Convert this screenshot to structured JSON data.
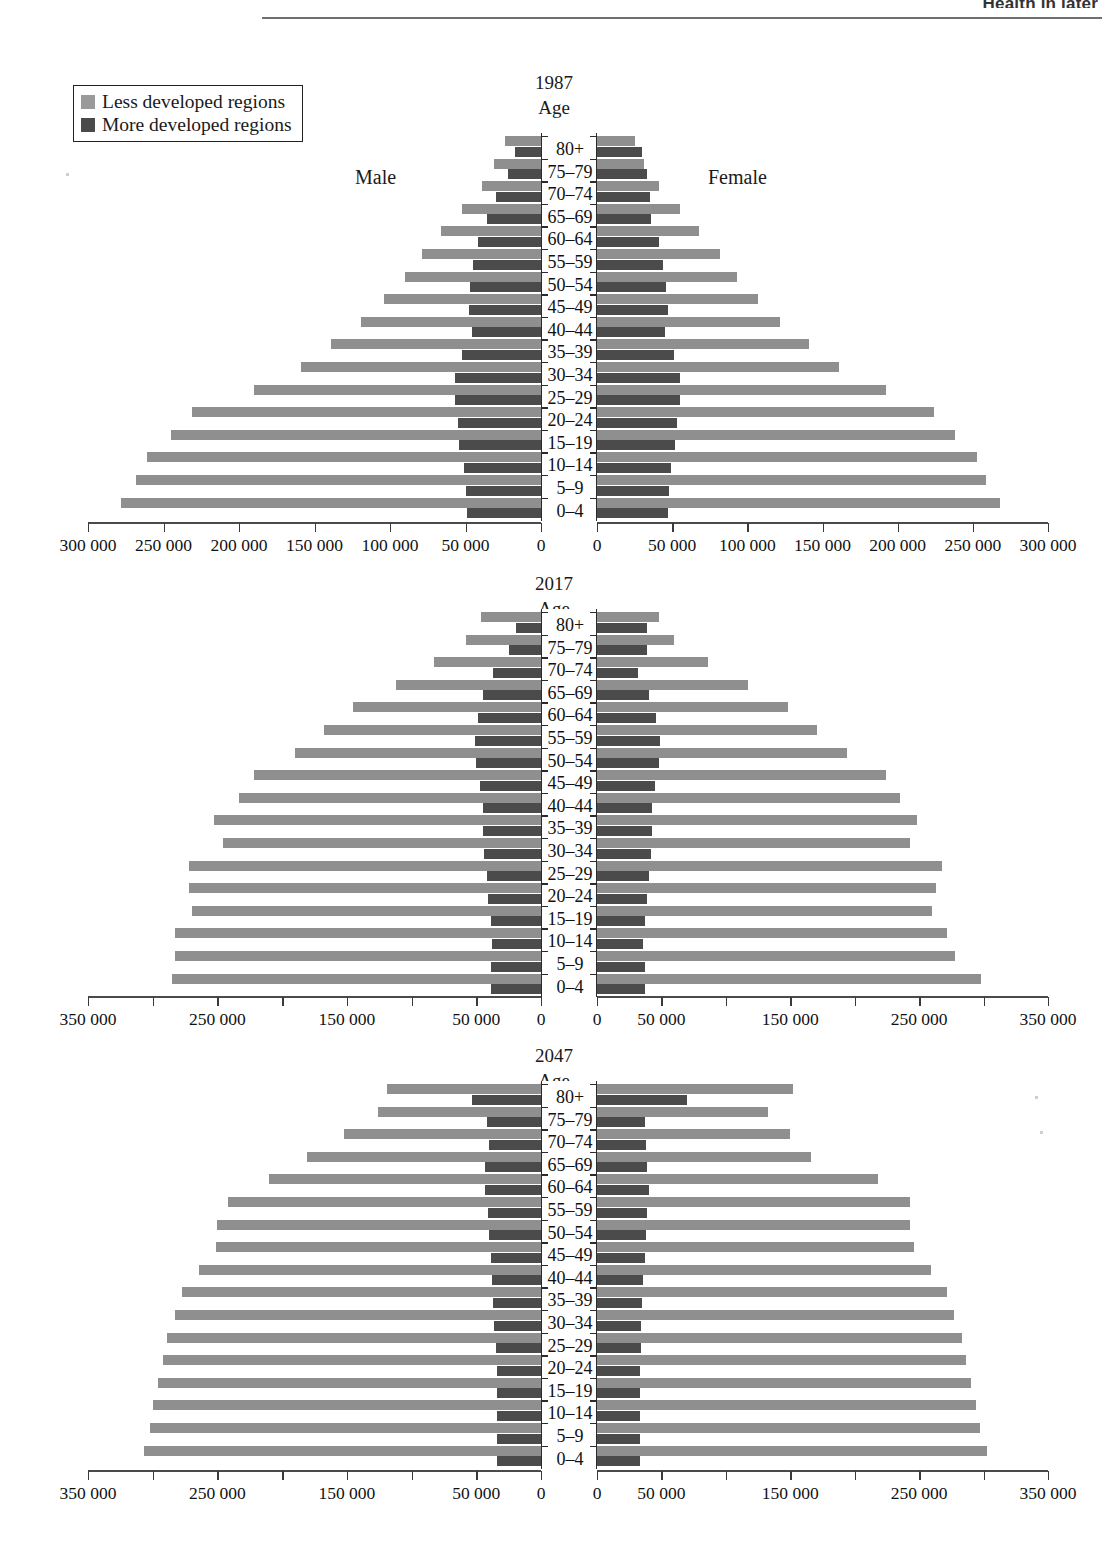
{
  "header": {
    "running_title": "Health in later"
  },
  "legend": {
    "items": [
      {
        "label": "Less developed regions",
        "color": "#9a9a9a",
        "key": "less"
      },
      {
        "label": "More developed regions",
        "color": "#4a4a4a",
        "key": "more"
      }
    ]
  },
  "labels": {
    "age_heading": "Age",
    "male": "Male",
    "female": "Female"
  },
  "age_groups": [
    "80+",
    "75–79",
    "70–74",
    "65–69",
    "60–64",
    "55–59",
    "50–54",
    "45–49",
    "40–44",
    "35–39",
    "30–34",
    "25–29",
    "20–24",
    "15–19",
    "10–14",
    "5–9",
    "0–4"
  ],
  "chart_data": [
    {
      "type": "bar",
      "subtype": "population-pyramid",
      "title": "1987",
      "xlabel": "",
      "ylabel": "Age",
      "xlim": [
        0,
        300000
      ],
      "axis_ticks": [
        300000,
        250000,
        200000,
        150000,
        100000,
        50000,
        0
      ],
      "axis_tick_labels": [
        "300 000",
        "250 000",
        "200 000",
        "150 000",
        "100 000",
        "50 000",
        "0"
      ],
      "axis_label_every": 50000,
      "grid": false,
      "legend_position": "top-left",
      "categories": [
        "80+",
        "75–79",
        "70–74",
        "65–69",
        "60–64",
        "55–59",
        "50–54",
        "45–49",
        "40–44",
        "35–39",
        "30–34",
        "25–29",
        "20–24",
        "15–19",
        "10–14",
        "5–9",
        "0–4"
      ],
      "series": [
        {
          "name": "Less developed regions",
          "side": "male",
          "values": [
            24000,
            31000,
            39000,
            52000,
            66000,
            79000,
            90000,
            104000,
            119000,
            139000,
            159000,
            190000,
            231000,
            245000,
            261000,
            268000,
            278000
          ]
        },
        {
          "name": "More developed regions",
          "side": "male",
          "values": [
            17000,
            22000,
            30000,
            36000,
            42000,
            45000,
            47000,
            48000,
            46000,
            52000,
            57000,
            57000,
            55000,
            54000,
            51000,
            50000,
            49000
          ]
        },
        {
          "name": "Less developed regions",
          "side": "female",
          "values": [
            25000,
            31000,
            41000,
            55000,
            68000,
            82000,
            93000,
            107000,
            122000,
            141000,
            161000,
            192000,
            224000,
            238000,
            253000,
            259000,
            268000
          ]
        },
        {
          "name": "More developed regions",
          "side": "female",
          "values": [
            30000,
            33000,
            35000,
            36000,
            41000,
            44000,
            46000,
            47000,
            45000,
            51000,
            55000,
            55000,
            53000,
            52000,
            49000,
            48000,
            47000
          ]
        }
      ]
    },
    {
      "type": "bar",
      "subtype": "population-pyramid",
      "title": "2017",
      "xlabel": "",
      "ylabel": "Age",
      "xlim": [
        0,
        350000
      ],
      "axis_ticks": [
        350000,
        300000,
        250000,
        200000,
        150000,
        100000,
        50000,
        0
      ],
      "axis_tick_labels": [
        "350 000",
        "",
        "250 000",
        "",
        "150 000",
        "",
        "50 000",
        "0"
      ],
      "axis_label_every": 100000,
      "grid": false,
      "legend_position": "none",
      "categories": [
        "80+",
        "75–79",
        "70–74",
        "65–69",
        "60–64",
        "55–59",
        "50–54",
        "45–49",
        "40–44",
        "35–39",
        "30–34",
        "25–29",
        "20–24",
        "15–19",
        "10–14",
        "5–9",
        "0–4"
      ],
      "series": [
        {
          "name": "Less developed regions",
          "side": "male",
          "values": [
            46000,
            58000,
            83000,
            112000,
            145000,
            168000,
            190000,
            222000,
            233000,
            253000,
            246000,
            272000,
            272000,
            270000,
            283000,
            283000,
            285000
          ]
        },
        {
          "name": "More developed regions",
          "side": "male",
          "values": [
            19000,
            25000,
            37000,
            45000,
            49000,
            51000,
            50000,
            47000,
            45000,
            45000,
            44000,
            42000,
            41000,
            39000,
            38000,
            39000,
            39000
          ]
        },
        {
          "name": "Less developed regions",
          "side": "female",
          "values": [
            48000,
            60000,
            86000,
            117000,
            148000,
            171000,
            194000,
            224000,
            235000,
            248000,
            243000,
            268000,
            263000,
            260000,
            272000,
            278000,
            298000
          ]
        },
        {
          "name": "More developed regions",
          "side": "female",
          "values": [
            39000,
            39000,
            32000,
            40000,
            46000,
            49000,
            48000,
            45000,
            43000,
            43000,
            42000,
            40000,
            39000,
            37000,
            36000,
            37000,
            37000
          ]
        }
      ]
    },
    {
      "type": "bar",
      "subtype": "population-pyramid",
      "title": "2047",
      "xlabel": "",
      "ylabel": "Age",
      "xlim": [
        0,
        350000
      ],
      "axis_ticks": [
        350000,
        300000,
        250000,
        200000,
        150000,
        100000,
        50000,
        0
      ],
      "axis_tick_labels": [
        "350 000",
        "",
        "250 000",
        "",
        "150 000",
        "",
        "50 000",
        "0"
      ],
      "axis_label_every": 100000,
      "grid": false,
      "legend_position": "none",
      "categories": [
        "80+",
        "75–79",
        "70–74",
        "65–69",
        "60–64",
        "55–59",
        "50–54",
        "45–49",
        "40–44",
        "35–39",
        "30–34",
        "25–29",
        "20–24",
        "15–19",
        "10–14",
        "5–9",
        "0–4"
      ],
      "series": [
        {
          "name": "Less developed regions",
          "side": "male",
          "values": [
            119000,
            126000,
            152000,
            181000,
            210000,
            242000,
            250000,
            251000,
            264000,
            277000,
            283000,
            289000,
            292000,
            296000,
            300000,
            302000,
            307000
          ]
        },
        {
          "name": "More developed regions",
          "side": "male",
          "values": [
            53000,
            42000,
            40000,
            43000,
            43000,
            41000,
            40000,
            39000,
            38000,
            37000,
            36000,
            35000,
            34000,
            34000,
            34000,
            34000,
            34000
          ]
        },
        {
          "name": "Less developed regions",
          "side": "female",
          "values": [
            152000,
            133000,
            150000,
            166000,
            218000,
            243000,
            243000,
            246000,
            259000,
            272000,
            277000,
            283000,
            286000,
            290000,
            294000,
            297000,
            303000
          ]
        },
        {
          "name": "More developed regions",
          "side": "female",
          "values": [
            70000,
            37000,
            38000,
            39000,
            40000,
            39000,
            38000,
            37000,
            36000,
            35000,
            34000,
            34000,
            33000,
            33000,
            33000,
            33000,
            33000
          ]
        }
      ]
    }
  ],
  "caption": {
    "text": ""
  }
}
